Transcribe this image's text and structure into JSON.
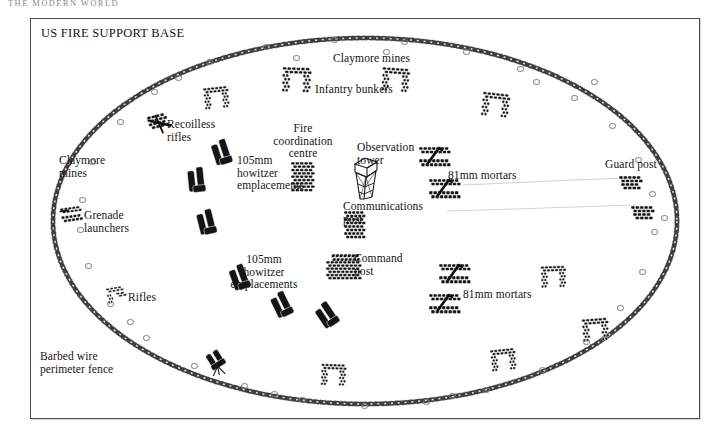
{
  "running_head": "The Modern World",
  "plate": {
    "title": "US FIRE SUPPORT BASE"
  },
  "colors": {
    "ink": "#141414",
    "frame": "#4a4a4a",
    "wire": "#3a3a3a",
    "mine_outline": "#7e7e7e",
    "paper": "#ffffff"
  },
  "labels": [
    {
      "id": "claymore-mines-top",
      "text": "Claymore mines",
      "x": 302,
      "y": 33,
      "align": "left",
      "name": "label-claymore-mines-top"
    },
    {
      "id": "infantry-bunkers",
      "text": "Infantry bunkers",
      "x": 284,
      "y": 64,
      "align": "left",
      "name": "label-infantry-bunkers"
    },
    {
      "id": "recoilless-rifles",
      "text": "Recoilless\nrifles",
      "x": 136,
      "y": 99,
      "align": "left",
      "name": "label-recoilless-rifles"
    },
    {
      "id": "claymore-mines-left",
      "text": "Claymore\nmines",
      "x": 28,
      "y": 135,
      "align": "left",
      "name": "label-claymore-mines-left"
    },
    {
      "id": "grenade-launchers",
      "text": "Grenade\nlaunchers",
      "x": 53,
      "y": 190,
      "align": "left",
      "name": "label-grenade-launchers"
    },
    {
      "id": "howitzers-upper",
      "text": "105mm\nhowitzer\nemplacements",
      "x": 206,
      "y": 135,
      "align": "left",
      "name": "label-105mm-howitzer-emplacements-upper"
    },
    {
      "id": "fire-coordination",
      "text": "Fire\ncoordination\ncentre",
      "x": 272,
      "y": 103,
      "align": "center",
      "name": "label-fire-coordination-centre"
    },
    {
      "id": "observation-tower",
      "text": "Observation\ntower",
      "x": 326,
      "y": 122,
      "align": "left",
      "name": "label-observation-tower"
    },
    {
      "id": "communications-post",
      "text": "Communications\npost",
      "x": 312,
      "y": 181,
      "align": "left",
      "name": "label-communications-post"
    },
    {
      "id": "mortars-upper",
      "text": "81mm mortars",
      "x": 417,
      "y": 150,
      "align": "left",
      "name": "label-81mm-mortars-upper"
    },
    {
      "id": "guard-post",
      "text": "Guard post",
      "x": 574,
      "y": 139,
      "align": "left",
      "name": "label-guard-post"
    },
    {
      "id": "howitzers-lower",
      "text": "105mm\nhowitzer\nemplacements",
      "x": 233,
      "y": 234,
      "align": "center",
      "name": "label-105mm-howitzer-emplacements-lower"
    },
    {
      "id": "command-post",
      "text": "Command\npost",
      "x": 323,
      "y": 233,
      "align": "left",
      "name": "label-command-post"
    },
    {
      "id": "mortars-lower",
      "text": "81mm mortars",
      "x": 432,
      "y": 269,
      "align": "left",
      "name": "label-81mm-mortars-lower"
    },
    {
      "id": "rifles",
      "text": "Rifles",
      "x": 97,
      "y": 272,
      "align": "left",
      "name": "label-rifles"
    },
    {
      "id": "barbed-wire-fence",
      "text": "Barbed wire\nperimeter fence",
      "x": 9,
      "y": 331,
      "align": "left",
      "name": "label-barbed-wire-perimeter-fence"
    }
  ],
  "symbols": [
    {
      "kind": "bunker",
      "x": 173,
      "y": 68,
      "rot": -6,
      "scale": 1.0,
      "name": "symbol-infantry-bunker"
    },
    {
      "kind": "bunker",
      "x": 253,
      "y": 50,
      "rot": 2,
      "scale": 1.15,
      "name": "symbol-infantry-bunker"
    },
    {
      "kind": "bunker",
      "x": 352,
      "y": 50,
      "rot": 4,
      "scale": 1.1,
      "name": "symbol-infantry-bunker"
    },
    {
      "kind": "bunker",
      "x": 452,
      "y": 75,
      "rot": 6,
      "scale": 1.1,
      "name": "symbol-infantry-bunker"
    },
    {
      "kind": "bunker",
      "x": 552,
      "y": 300,
      "rot": -4,
      "scale": 1.05,
      "name": "symbol-infantry-bunker"
    },
    {
      "kind": "bunker",
      "x": 510,
      "y": 247,
      "rot": -2,
      "scale": 1.0,
      "name": "symbol-infantry-bunker"
    },
    {
      "kind": "bunker",
      "x": 290,
      "y": 345,
      "rot": 2,
      "scale": 1.0,
      "name": "symbol-infantry-bunker"
    },
    {
      "kind": "recoilless",
      "x": 118,
      "y": 95,
      "rot": -14,
      "scale": 1.0,
      "name": "symbol-recoilless-rifle"
    },
    {
      "kind": "grenade",
      "x": 30,
      "y": 188,
      "rot": -8,
      "scale": 1.0,
      "name": "symbol-grenade-launcher"
    },
    {
      "kind": "rifle",
      "x": 76,
      "y": 268,
      "rot": -10,
      "scale": 1.0,
      "name": "symbol-rifle"
    },
    {
      "kind": "howitzer",
      "x": 180,
      "y": 120,
      "rot": 16,
      "scale": 1.0,
      "name": "symbol-105mm-howitzer"
    },
    {
      "kind": "howitzer",
      "x": 155,
      "y": 148,
      "rot": 28,
      "scale": 1.0,
      "name": "symbol-105mm-howitzer"
    },
    {
      "kind": "howitzer",
      "x": 165,
      "y": 190,
      "rot": 20,
      "scale": 1.0,
      "name": "symbol-105mm-howitzer"
    },
    {
      "kind": "howitzer",
      "x": 198,
      "y": 245,
      "rot": 14,
      "scale": 1.0,
      "name": "symbol-105mm-howitzer"
    },
    {
      "kind": "howitzer",
      "x": 240,
      "y": 272,
      "rot": 8,
      "scale": 1.0,
      "name": "symbol-105mm-howitzer"
    },
    {
      "kind": "howitzer",
      "x": 285,
      "y": 282,
      "rot": 0,
      "scale": 1.0,
      "name": "symbol-105mm-howitzer"
    },
    {
      "kind": "firecoord",
      "x": 260,
      "y": 143,
      "rot": 0,
      "scale": 1.0,
      "name": "symbol-fire-coordination-centre"
    },
    {
      "kind": "tower",
      "x": 318,
      "y": 135,
      "rot": 0,
      "scale": 1.0,
      "name": "symbol-observation-tower"
    },
    {
      "kind": "comms",
      "x": 313,
      "y": 192,
      "rot": 0,
      "scale": 1.0,
      "name": "symbol-communications-post"
    },
    {
      "kind": "command",
      "x": 295,
      "y": 235,
      "rot": 0,
      "scale": 1.0,
      "name": "symbol-command-post"
    },
    {
      "kind": "mortar",
      "x": 388,
      "y": 128,
      "rot": 0,
      "scale": 1.0,
      "name": "symbol-81mm-mortar"
    },
    {
      "kind": "mortar",
      "x": 398,
      "y": 160,
      "rot": 0,
      "scale": 1.0,
      "name": "symbol-81mm-mortar"
    },
    {
      "kind": "mortar",
      "x": 408,
      "y": 245,
      "rot": 0,
      "scale": 1.0,
      "name": "symbol-81mm-mortar"
    },
    {
      "kind": "mortar",
      "x": 398,
      "y": 275,
      "rot": 0,
      "scale": 1.0,
      "name": "symbol-81mm-mortar"
    },
    {
      "kind": "guard",
      "x": 588,
      "y": 157,
      "rot": 0,
      "scale": 1.0,
      "name": "symbol-guard-post"
    },
    {
      "kind": "guard",
      "x": 600,
      "y": 187,
      "rot": 0,
      "scale": 1.0,
      "name": "symbol-guard-post"
    },
    {
      "kind": "aagun",
      "x": 175,
      "y": 330,
      "rot": -10,
      "scale": 1.0,
      "name": "symbol-anti-aircraft-gun"
    },
    {
      "kind": "bunker",
      "x": 460,
      "y": 330,
      "rot": -6,
      "scale": 1.0,
      "name": "symbol-infantry-bunker"
    }
  ],
  "mines": [
    {
      "x": 175,
      "y": 40
    },
    {
      "x": 232,
      "y": 25
    },
    {
      "x": 300,
      "y": 18
    },
    {
      "x": 370,
      "y": 20
    },
    {
      "x": 432,
      "y": 30
    },
    {
      "x": 486,
      "y": 47
    },
    {
      "x": 120,
      "y": 70
    },
    {
      "x": 86,
      "y": 100
    },
    {
      "x": 58,
      "y": 140
    },
    {
      "x": 48,
      "y": 178
    },
    {
      "x": 540,
      "y": 76
    },
    {
      "x": 578,
      "y": 104
    },
    {
      "x": 604,
      "y": 138
    },
    {
      "x": 618,
      "y": 172
    },
    {
      "x": 620,
      "y": 210
    },
    {
      "x": 608,
      "y": 250
    },
    {
      "x": 586,
      "y": 286
    },
    {
      "x": 552,
      "y": 320
    },
    {
      "x": 508,
      "y": 348
    },
    {
      "x": 452,
      "y": 368
    },
    {
      "x": 392,
      "y": 380
    },
    {
      "x": 330,
      "y": 384
    },
    {
      "x": 268,
      "y": 378
    },
    {
      "x": 210,
      "y": 364
    },
    {
      "x": 160,
      "y": 344
    },
    {
      "x": 112,
      "y": 316
    },
    {
      "x": 76,
      "y": 282
    },
    {
      "x": 54,
      "y": 244
    },
    {
      "x": 46,
      "y": 208
    },
    {
      "x": 262,
      "y": 36
    },
    {
      "x": 352,
      "y": 30
    },
    {
      "x": 144,
      "y": 56
    },
    {
      "x": 502,
      "y": 60
    },
    {
      "x": 630,
      "y": 196
    },
    {
      "x": 96,
      "y": 300
    },
    {
      "x": 240,
      "y": 372
    },
    {
      "x": 418,
      "y": 374
    },
    {
      "x": 560,
      "y": 60
    }
  ]
}
